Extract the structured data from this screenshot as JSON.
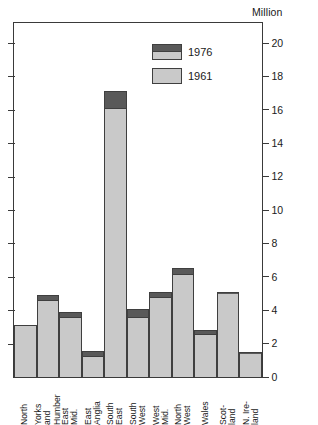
{
  "chart_data": {
    "type": "bar",
    "subtype": "overlapping-stacked-two-series",
    "title": "",
    "unit_caption": "Million",
    "xlabel": "",
    "ylabel": "Million",
    "ylim": [
      0,
      21.2
    ],
    "y_ticks": [
      0,
      2,
      4,
      6,
      8,
      10,
      12,
      14,
      16,
      18,
      20
    ],
    "grid": false,
    "legend_position": "inside-top-center",
    "categories": [
      "North",
      "Yorks and Humber",
      "East Mid.",
      "East Anglia",
      "South East",
      "South West",
      "West Mid.",
      "North West",
      "Wales",
      "Scot-land",
      "N. Ire-land"
    ],
    "category_label_lines": [
      [
        "North"
      ],
      [
        "Yorks",
        "and",
        "Humber"
      ],
      [
        "East",
        "Mid."
      ],
      [
        "East",
        "Anglia"
      ],
      [
        "South",
        "East"
      ],
      [
        "South",
        "West"
      ],
      [
        "West",
        "Mid."
      ],
      [
        "North",
        "West"
      ],
      [
        "Wales"
      ],
      [
        "Scot-",
        "land"
      ],
      [
        "N. Ire-",
        "land"
      ]
    ],
    "series": [
      {
        "name": "1961",
        "color": "#c9c9c9",
        "values": [
          3.1,
          4.6,
          3.6,
          1.25,
          16.1,
          3.6,
          4.8,
          6.15,
          2.6,
          5.05,
          1.45
        ]
      },
      {
        "name": "1976",
        "color": "#595959",
        "values": [
          3.1,
          4.9,
          3.9,
          1.55,
          17.1,
          4.1,
          5.1,
          6.5,
          2.8,
          5.1,
          1.5
        ]
      }
    ]
  },
  "legend": {
    "entries": [
      {
        "label": "1976",
        "swatch": "dual"
      },
      {
        "label": "1961",
        "swatch": "light"
      }
    ]
  },
  "colors": {
    "series_1976": "#595959",
    "series_1961": "#c9c9c9",
    "outline": "#3f3f3f",
    "axis": "#3a3a3a",
    "background": "#ffffff",
    "text": "#1a1a1a"
  }
}
